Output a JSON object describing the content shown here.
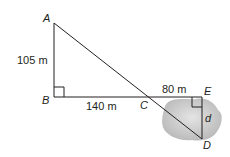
{
  "diagram": {
    "points": {
      "A": "A",
      "B": "B",
      "C": "C",
      "D": "D",
      "E": "E"
    },
    "measures": {
      "AB": "105 m",
      "BC": "140 m",
      "CE": "80 m",
      "ED": "d"
    },
    "colors": {
      "line": "#231f20",
      "lake": "#c8c8c8"
    }
  }
}
